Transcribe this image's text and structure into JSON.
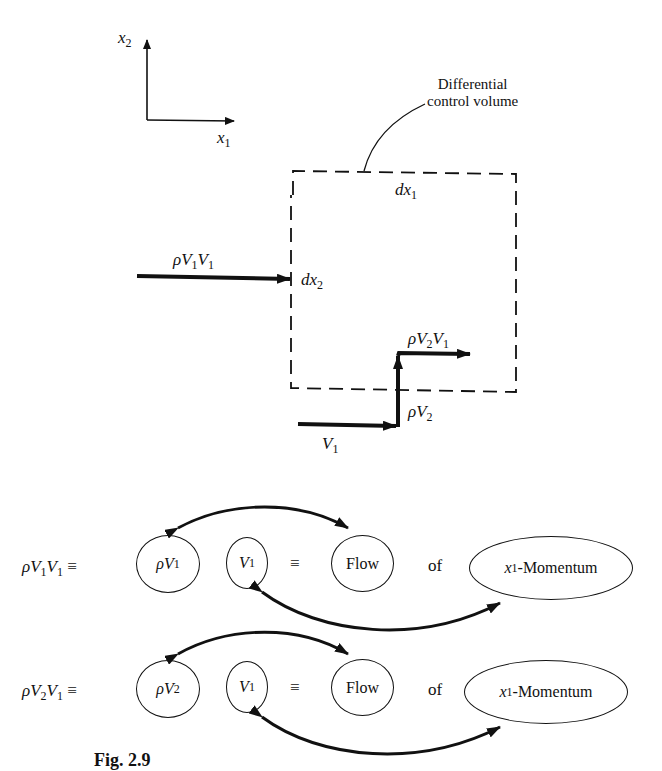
{
  "axes": {
    "x_label": "x",
    "x_sub": "1",
    "y_label": "x",
    "y_sub": "2"
  },
  "control_volume": {
    "annotation_line1": "Differential",
    "annotation_line2": "control volume",
    "width_label": "dx",
    "width_sub": "1",
    "height_label": "dx",
    "height_sub": "2"
  },
  "fluxes": {
    "left_in": {
      "rho": "ρ",
      "a": "V",
      "a_sub": "1",
      "b": "V",
      "b_sub": "1"
    },
    "top_out": {
      "rho": "ρ",
      "a": "V",
      "a_sub": "2",
      "b": "V",
      "b_sub": "1"
    },
    "vertical": {
      "rho": "ρ",
      "a": "V",
      "a_sub": "2"
    },
    "bottom_in": {
      "a": "V",
      "a_sub": "1"
    }
  },
  "equations": [
    {
      "lhs_rho": "ρ",
      "lhs_a": "V",
      "lhs_a_sub": "1",
      "lhs_b": "V",
      "lhs_b_sub": "1",
      "equiv": "≡",
      "mass_flux_rho": "ρ",
      "mass_flux_v": "V",
      "mass_flux_sub": "1",
      "velocity": "V",
      "velocity_sub": "1",
      "equiv2": "≡",
      "flow": "Flow",
      "of": "of",
      "momentum_x": "x",
      "momentum_sub": "1",
      "momentum_word": "-Momentum"
    },
    {
      "lhs_rho": "ρ",
      "lhs_a": "V",
      "lhs_a_sub": "2",
      "lhs_b": "V",
      "lhs_b_sub": "1",
      "equiv": "≡",
      "mass_flux_rho": "ρ",
      "mass_flux_v": "V",
      "mass_flux_sub": "2",
      "velocity": "V",
      "velocity_sub": "1",
      "equiv2": "≡",
      "flow": "Flow",
      "of": "of",
      "momentum_x": "x",
      "momentum_sub": "1",
      "momentum_word": "-Momentum"
    }
  ],
  "caption": "Fig. 2.9"
}
